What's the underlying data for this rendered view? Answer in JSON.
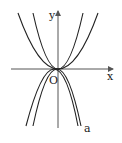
{
  "diagram": {
    "type": "function-graph",
    "axes": {
      "x_label": "x",
      "y_label": "y",
      "origin_label": "O"
    },
    "curves": [
      {
        "name": "up-wide",
        "direction": "up",
        "label": ""
      },
      {
        "name": "up-narrow",
        "direction": "up",
        "label": ""
      },
      {
        "name": "down-narrow",
        "direction": "down",
        "label": ""
      },
      {
        "name": "down-wide",
        "direction": "down",
        "label": "a"
      }
    ],
    "colors": {
      "curve": "#222222",
      "axis": "#555555"
    }
  }
}
